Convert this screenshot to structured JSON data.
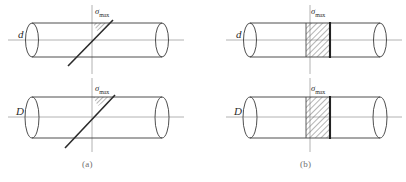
{
  "figure": {
    "width": 406,
    "height": 182,
    "background": "#ffffff",
    "line_color": "#3a3a3a",
    "axis_color": "#9a9a9a",
    "hatch_color": "#555555",
    "caption_color": "#6f6f6f"
  },
  "captions": {
    "a": "(a)",
    "b": "(b)"
  },
  "panels": [
    {
      "id": "panel-a-top",
      "column": "a",
      "row": "top",
      "diameter_label": "d",
      "stress_label": "σ",
      "stress_subscript": "max",
      "fracture_type": "inclined",
      "fracture_angle_deg": 45,
      "hatch_region": "small-wedge-top"
    },
    {
      "id": "panel-a-bottom",
      "column": "a",
      "row": "bottom",
      "diameter_label": "D",
      "stress_label": "σ",
      "stress_subscript": "max",
      "fracture_type": "inclined",
      "fracture_angle_deg": 45,
      "hatch_region": "small-wedge-top"
    },
    {
      "id": "panel-b-top",
      "column": "b",
      "row": "top",
      "diameter_label": "d",
      "stress_label": "σ",
      "stress_subscript": "max",
      "fracture_type": "transverse",
      "fracture_angle_deg": 90,
      "hatch_region": "full-band"
    },
    {
      "id": "panel-b-bottom",
      "column": "b",
      "row": "bottom",
      "diameter_label": "D",
      "stress_label": "σ",
      "stress_subscript": "max",
      "fracture_type": "transverse",
      "fracture_angle_deg": 90,
      "hatch_region": "full-band"
    }
  ]
}
